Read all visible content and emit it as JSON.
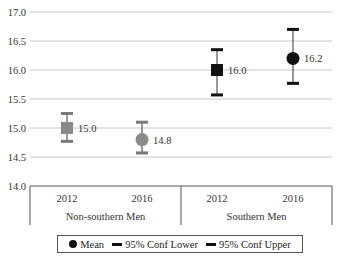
{
  "chart_data": {
    "type": "scatter",
    "title": "",
    "xlabel": "",
    "ylabel": "",
    "ylim": [
      14.0,
      17.0
    ],
    "yticks": [
      "17.0",
      "16.5",
      "16.0",
      "15.5",
      "15.0",
      "14.5",
      "14.0"
    ],
    "grid": true,
    "groups": [
      {
        "name": "Non-southern Men",
        "categories": [
          "2012",
          "2016"
        ]
      },
      {
        "name": "Southern Men",
        "categories": [
          "2012",
          "2016"
        ]
      }
    ],
    "points": [
      {
        "group": "Non-southern Men",
        "year": "2012",
        "mean": 15.0,
        "lower": 14.77,
        "upper": 15.25,
        "label": "15.0",
        "marker": "square",
        "color": "#8a8a8a"
      },
      {
        "group": "Non-southern Men",
        "year": "2016",
        "mean": 14.8,
        "lower": 14.57,
        "upper": 15.1,
        "label": "14.8",
        "marker": "circle",
        "color": "#8a8a8a"
      },
      {
        "group": "Southern Men",
        "year": "2012",
        "mean": 16.0,
        "lower": 15.57,
        "upper": 16.35,
        "label": "16.0",
        "marker": "square",
        "color": "#111111"
      },
      {
        "group": "Southern Men",
        "year": "2016",
        "mean": 16.2,
        "lower": 15.77,
        "upper": 16.7,
        "label": "16.2",
        "marker": "circle",
        "color": "#111111"
      }
    ],
    "legend": {
      "position": "bottom",
      "entries": [
        "Mean",
        "95% Conf Lower",
        "95% Conf Upper"
      ]
    }
  },
  "legend": {
    "mean": "Mean",
    "lower": "95% Conf Lower",
    "upper": "95% Conf Upper"
  }
}
